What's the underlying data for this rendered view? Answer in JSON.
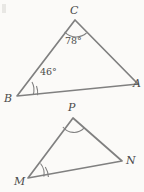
{
  "figure": {
    "kind": "geometry-diagram",
    "background_color": "#fbfaf8",
    "stroke_color": "#808080",
    "text_color": "#4a4a4a",
    "width": 144,
    "height": 192
  },
  "triangles": [
    {
      "id": "upper",
      "name": "triangle-abc",
      "vertices": [
        {
          "label": "C",
          "x": 75,
          "y": 20,
          "label_x": 70,
          "label_y": 5
        },
        {
          "label": "A",
          "x": 138,
          "y": 84,
          "label_x": 133,
          "label_y": 80
        },
        {
          "label": "B",
          "x": 17,
          "y": 96,
          "label_x": 5,
          "label_y": 94
        }
      ],
      "angles": [
        {
          "at": "C",
          "value": "78°",
          "arcs": 1,
          "label_x": 65,
          "label_y": 35
        },
        {
          "at": "B",
          "value": "46°",
          "arcs": 2,
          "label_x": 39,
          "label_y": 67
        }
      ]
    },
    {
      "id": "lower",
      "name": "triangle-mpn",
      "vertices": [
        {
          "label": "P",
          "x": 73,
          "y": 118,
          "label_x": 68,
          "label_y": 102
        },
        {
          "label": "N",
          "x": 122,
          "y": 161,
          "label_x": 126,
          "label_y": 157
        },
        {
          "label": "M",
          "x": 28,
          "y": 178,
          "label_x": 15,
          "label_y": 177
        }
      ],
      "angles": [
        {
          "at": "P",
          "value": "",
          "arcs": 1,
          "label_x": 0,
          "label_y": 0
        },
        {
          "at": "M",
          "value": "",
          "arcs": 2,
          "label_x": 0,
          "label_y": 0
        }
      ]
    }
  ]
}
